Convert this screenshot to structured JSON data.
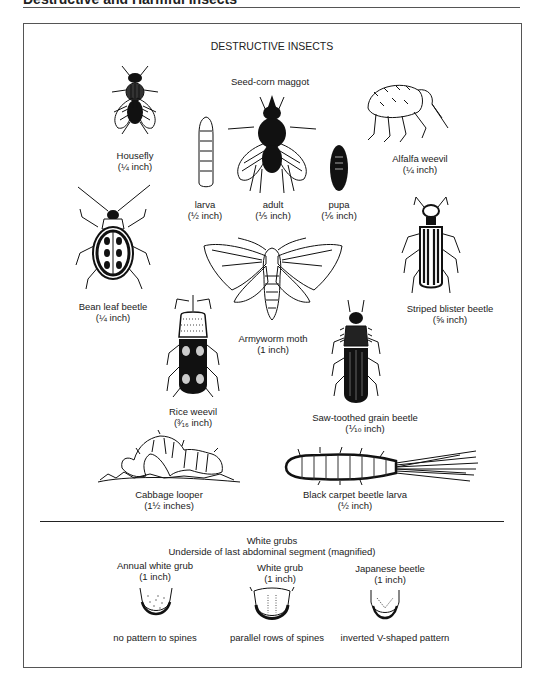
{
  "page": {
    "header_title": "Destructive and Harmful Insects"
  },
  "figure": {
    "title": "DESTRUCTIVE INSECTS",
    "insects": {
      "housefly": {
        "name": "Housefly",
        "size": "(¼ inch)"
      },
      "seed_corn_maggot": {
        "name": "Seed-corn maggot",
        "stages": [
          {
            "name": "larva",
            "size": "(½ inch)"
          },
          {
            "name": "adult",
            "size": "(⅕ inch)"
          },
          {
            "name": "pupa",
            "size": "(⅙ inch)"
          }
        ]
      },
      "alfalfa_weevil": {
        "name": "Alfalfa weevil",
        "size": "(¼ inch)"
      },
      "bean_leaf_beetle": {
        "name": "Bean leaf beetle",
        "size": "(¼ inch)"
      },
      "armyworm_moth": {
        "name": "Armyworm moth",
        "size": "(1 inch)"
      },
      "striped_blister_beetle": {
        "name": "Striped blister beetle",
        "size": "(⅝ inch)"
      },
      "rice_weevil": {
        "name": "Rice weevil",
        "size": "(³⁄₁₆ inch)"
      },
      "saw_toothed_grain_beetle": {
        "name": "Saw-toothed grain beetle",
        "size": "(⅒ inch)"
      },
      "cabbage_looper": {
        "name": "Cabbage looper",
        "size": "(1½ inches)"
      },
      "black_carpet_beetle_larva": {
        "name": "Black carpet beetle larva",
        "size": "(½ inch)"
      }
    },
    "white_grubs": {
      "title": "White grubs",
      "subtitle": "Underside of last abdominal segment (magnified)",
      "items": [
        {
          "name": "Annual white grub",
          "size": "(1 inch)",
          "pattern": "no pattern to spines"
        },
        {
          "name": "White grub",
          "size": "(1 inch)",
          "pattern": "parallel rows of spines"
        },
        {
          "name": "Japanese beetle",
          "size": "(1 inch)",
          "pattern": "inverted V-shaped pattern"
        }
      ]
    }
  }
}
